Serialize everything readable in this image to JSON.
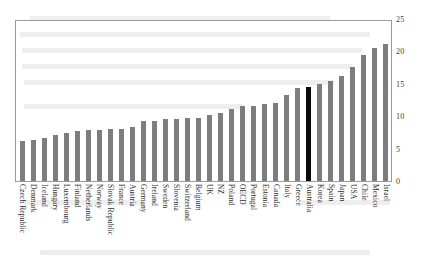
{
  "chart_data": {
    "type": "bar",
    "title": "",
    "subtitle": "",
    "xlabel": "",
    "ylabel": "",
    "ylim": [
      0,
      25
    ],
    "yticks": [
      0,
      5,
      10,
      15,
      20,
      25
    ],
    "ytick_labels": [
      "0",
      "5",
      "10",
      "15",
      "20",
      "25"
    ],
    "grid": false,
    "legend": null,
    "highlight_category": "Australia",
    "colors": {
      "bar": "#7d7d7d",
      "highlight_bar": "#0a0a0a",
      "axis": "#9a9a9a",
      "text": "#2e2e2e",
      "background": "#ffffff"
    },
    "categories": [
      "Czech Republic",
      "Denmark",
      "Iceland",
      "Hungary",
      "Luxembourg",
      "Finland",
      "Netherlands",
      "Norway",
      "Slovak Republic",
      "France",
      "Austria",
      "Germany",
      "Ireland",
      "Sweden",
      "Slovenia",
      "Switzerland",
      "Belgium",
      "UK",
      "NZ",
      "Poland",
      "OECD",
      "Portugal",
      "Estonia",
      "Canada",
      "Italy",
      "Greece",
      "Australia",
      "Korea",
      "Spain",
      "Japan",
      "USA",
      "Chile",
      "Mexico",
      "Israel"
    ],
    "values": [
      6.2,
      6.4,
      6.7,
      7.1,
      7.4,
      7.7,
      7.8,
      7.9,
      8.0,
      8.1,
      8.3,
      9.2,
      9.2,
      9.5,
      9.5,
      9.7,
      9.8,
      10.2,
      10.5,
      11.1,
      11.6,
      11.6,
      11.9,
      12.1,
      13.2,
      14.4,
      14.5,
      15.0,
      15.5,
      16.2,
      17.6,
      19.4,
      20.5,
      21.1
    ]
  }
}
